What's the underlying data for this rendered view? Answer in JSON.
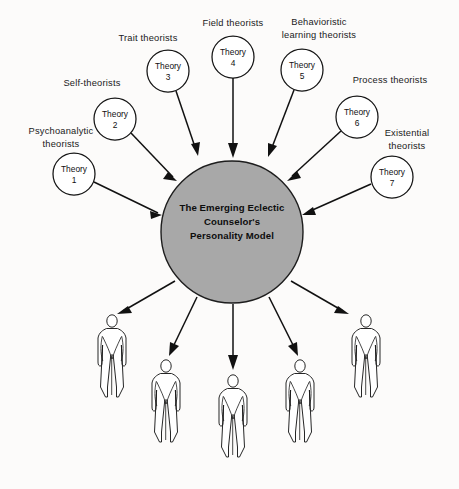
{
  "diagram": {
    "title_text": "",
    "hub": {
      "label_lines": [
        "The Emerging Eclectic",
        "Counselor's",
        "Personality Model"
      ],
      "fill_color": "#a8a8a8",
      "stroke_color": "#1d1d1d",
      "cx": 232,
      "cy": 232,
      "r": 71
    },
    "theories": [
      {
        "id": "theory-1",
        "node_line1": "Theory",
        "node_line2": "1",
        "label_lines": [
          "Psychoanalytic",
          "theorists"
        ],
        "cx": 74,
        "cy": 174,
        "r": 21,
        "label_x": 61,
        "label_y": 131
      },
      {
        "id": "theory-2",
        "node_line1": "Theory",
        "node_line2": "2",
        "label_lines": [
          "Self-theorists"
        ],
        "cx": 115,
        "cy": 119,
        "r": 21,
        "label_x": 92,
        "label_y": 82
      },
      {
        "id": "theory-3",
        "node_line1": "Theory",
        "node_line2": "3",
        "label_lines": [
          "Trait theorists"
        ],
        "cx": 168,
        "cy": 71,
        "r": 21,
        "label_x": 145,
        "label_y": 38
      },
      {
        "id": "theory-4",
        "node_line1": "Theory",
        "node_line2": "4",
        "label_lines": [
          "Field theorists"
        ],
        "cx": 233,
        "cy": 57,
        "r": 21,
        "label_x": 233,
        "label_y": 24
      },
      {
        "id": "theory-5",
        "node_line1": "Theory",
        "node_line2": "5",
        "label_lines": [
          "Behavioristic",
          "learning theorists"
        ],
        "cx": 302,
        "cy": 70,
        "r": 21,
        "label_x": 318,
        "label_y": 25
      },
      {
        "id": "theory-6",
        "node_line1": "Theory",
        "node_line2": "6",
        "label_lines": [
          "Process theorists"
        ],
        "cx": 357,
        "cy": 117,
        "r": 21,
        "label_x": 389,
        "label_y": 81
      },
      {
        "id": "theory-7",
        "node_line1": "Theory",
        "node_line2": "7",
        "label_lines": [
          "Existential",
          "theorists"
        ],
        "cx": 392,
        "cy": 177,
        "r": 21,
        "label_x": 404,
        "label_y": 133
      }
    ],
    "figures": [
      {
        "id": "figure-1",
        "x": 112,
        "y": 315,
        "scale": 1.0
      },
      {
        "id": "figure-2",
        "x": 166,
        "y": 360,
        "scale": 1.0
      },
      {
        "id": "figure-3",
        "x": 233,
        "y": 375,
        "scale": 1.0
      },
      {
        "id": "figure-4",
        "x": 300,
        "y": 360,
        "scale": 1.0
      },
      {
        "id": "figure-5",
        "x": 366,
        "y": 315,
        "scale": 1.0
      }
    ],
    "colors": {
      "background": "#fcfbfa",
      "hub_fill": "#a8a8a8",
      "line": "#111111",
      "text": "#1a1a1a"
    }
  }
}
